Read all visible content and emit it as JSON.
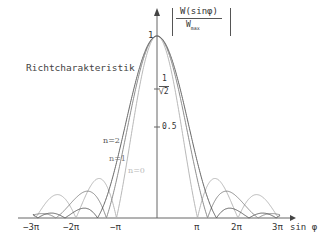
{
  "chart_data": {
    "type": "line",
    "title": "Richtcharakteristik",
    "ylabel": "|W(sin φ) / W_max|",
    "xlabel": "sin φ",
    "x_ticks": [
      "-3π",
      "-2π",
      "-π",
      "π",
      "2π",
      "3π"
    ],
    "y_ticks": [
      "1",
      "1/√2",
      "0.5"
    ],
    "xlim": [
      -3.14,
      3.14
    ],
    "ylim": [
      0,
      1
    ],
    "series": [
      {
        "name": "n=0",
        "color": "#b0b0b0",
        "description": "narrowest main lobe, first zero at ±π, side lobes 0.22 and 0.13"
      },
      {
        "name": "n=1",
        "color": "#808080",
        "description": "intermediate main lobe"
      },
      {
        "name": "n=2",
        "color": "#555555",
        "description": "widest main lobe"
      }
    ],
    "grid": false
  },
  "labels": {
    "title": "Richtcharakteristik",
    "ylabel_num": "W(sinφ)",
    "ylabel_den": "W",
    "ylabel_den_sub": "max",
    "y_one": "1",
    "y_sqrt_num": "1",
    "y_sqrt_den": "√2",
    "y_half": "0.5",
    "x_m3pi": "−3π",
    "x_m2pi": "−2π",
    "x_mpi": "−π",
    "x_pi": "π",
    "x_2pi": "2π",
    "x_3pi": "3π",
    "x_axis": "sin φ",
    "n2": "n=2",
    "n1": "n=1",
    "n0": "n=0"
  }
}
